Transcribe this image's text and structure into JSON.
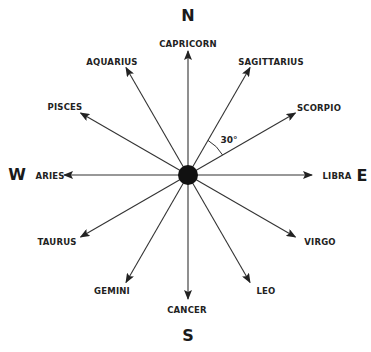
{
  "diagram": {
    "center": {
      "x": 188,
      "y": 175,
      "radius": 10
    },
    "arrow_length": 124,
    "line_color": "#333333",
    "dot_color": "#111111",
    "cardinals": [
      {
        "label": "N",
        "x": 188,
        "y": 16
      },
      {
        "label": "E",
        "x": 362,
        "y": 176
      },
      {
        "label": "S",
        "x": 188,
        "y": 336
      },
      {
        "label": "W",
        "x": 17,
        "y": 175
      }
    ],
    "signs": [
      {
        "label": "CAPRICORN",
        "angle_deg": 90,
        "x": 188,
        "y": 44
      },
      {
        "label": "SAGITTARIUS",
        "angle_deg": 60,
        "x": 271,
        "y": 62
      },
      {
        "label": "SCORPIO",
        "angle_deg": 30,
        "x": 319,
        "y": 108
      },
      {
        "label": "LIBRA",
        "angle_deg": 0,
        "x": 337,
        "y": 176
      },
      {
        "label": "VIRGO",
        "angle_deg": -30,
        "x": 320,
        "y": 242
      },
      {
        "label": "LEO",
        "angle_deg": -60,
        "x": 266,
        "y": 291
      },
      {
        "label": "CANCER",
        "angle_deg": -90,
        "x": 187,
        "y": 310
      },
      {
        "label": "GEMINI",
        "angle_deg": -120,
        "x": 112,
        "y": 291
      },
      {
        "label": "TAURUS",
        "angle_deg": -150,
        "x": 57,
        "y": 242
      },
      {
        "label": "ARIES",
        "angle_deg": 180,
        "x": 50,
        "y": 176
      },
      {
        "label": "PISCES",
        "angle_deg": 150,
        "x": 65,
        "y": 107
      },
      {
        "label": "AQUARIUS",
        "angle_deg": 120,
        "x": 112,
        "y": 62
      }
    ],
    "angle_annotation": {
      "label": "30°",
      "x": 229,
      "y": 140,
      "from_deg": 30,
      "to_deg": 60,
      "arc_radius": 40
    }
  }
}
